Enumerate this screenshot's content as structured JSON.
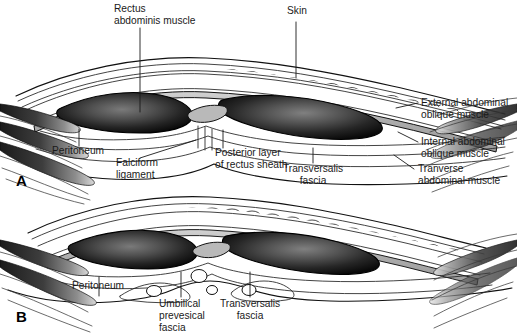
{
  "figure": {
    "background_color": "#ffffff",
    "ink_color": "#1a1a1a",
    "width": 517,
    "height": 334
  },
  "panels": [
    {
      "id": "A",
      "letter": "A",
      "description": "Cross-section above the arcuate line showing posterior layer of rectus sheath"
    },
    {
      "id": "B",
      "letter": "B",
      "description": "Cross-section at the umbilical level showing umbilical prevesical fascia"
    }
  ],
  "labels": {
    "panel_a": [
      {
        "key": "rectus",
        "lines": [
          "Rectus",
          "abdominis muscle"
        ],
        "anchor": "start"
      },
      {
        "key": "skin",
        "lines": [
          "Skin"
        ],
        "anchor": "start"
      },
      {
        "key": "external_oblique",
        "lines": [
          "External abdominal",
          "oblique muscle"
        ],
        "anchor": "start"
      },
      {
        "key": "internal_oblique",
        "lines": [
          "Internal abdominal",
          "oblique muscle"
        ],
        "anchor": "start"
      },
      {
        "key": "transverse",
        "lines": [
          "Tranverse",
          "abdominal muscle"
        ],
        "anchor": "start"
      },
      {
        "key": "peritoneum",
        "lines": [
          "Peritoneum"
        ],
        "anchor": "start"
      },
      {
        "key": "falciform",
        "lines": [
          "Falciform",
          "ligament"
        ],
        "anchor": "start"
      },
      {
        "key": "posterior_layer",
        "lines": [
          "Posterior layer",
          "of rectus sheath"
        ],
        "anchor": "start"
      },
      {
        "key": "transversalis",
        "lines": [
          "Transversalis",
          "fascia"
        ],
        "anchor": "middle"
      }
    ],
    "panel_b": [
      {
        "key": "peritoneum",
        "lines": [
          "Peritoneum"
        ],
        "anchor": "start"
      },
      {
        "key": "umbilical",
        "lines": [
          "Umbilical",
          "prevesical",
          "fascia"
        ],
        "anchor": "start"
      },
      {
        "key": "transversalis",
        "lines": [
          "Transversalis",
          "fascia"
        ],
        "anchor": "middle"
      }
    ]
  },
  "label_text": {
    "rectus_line1": "Rectus",
    "rectus_line2": "abdominis muscle",
    "skin": "Skin",
    "external_oblique_line1": "External abdominal",
    "external_oblique_line2": "oblique muscle",
    "internal_oblique_line1": "Internal abdominal",
    "internal_oblique_line2": "oblique muscle",
    "transverse_line1": "Tranverse",
    "transverse_line2": "abdominal muscle",
    "peritoneum_a": "Peritoneum",
    "falciform_line1": "Falciform",
    "falciform_line2": "ligament",
    "posterior_layer_line1": "Posterior layer",
    "posterior_layer_line2": "of rectus sheath",
    "transversalis_a_line1": "Transversalis",
    "transversalis_a_line2": "fascia",
    "peritoneum_b": "Peritoneum",
    "umbilical_line1": "Umbilical",
    "umbilical_line2": "prevesical",
    "umbilical_line3": "fascia",
    "transversalis_b_line1": "Transversalis",
    "transversalis_b_line2": "fascia",
    "panel_a_letter": "A",
    "panel_b_letter": "B"
  },
  "colors": {
    "background": "#ffffff",
    "outline": "#111111",
    "muscle_dark": "#1b1b1b",
    "muscle_mid": "#4a4a4a",
    "muscle_highlight": "#6f6f6f",
    "fascia_gray": "#b9b9b9",
    "fat_fill": "#ffffff",
    "text": "#1a1a1a"
  }
}
